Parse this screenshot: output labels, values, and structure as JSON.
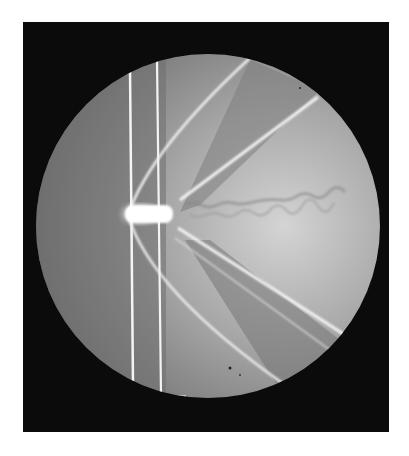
{
  "image": {
    "description": "Shadowgraph photograph of a bullet in supersonic flight showing bow shock, trailing shock waves and turbulent wake inside a circular viewing field",
    "colors": {
      "background": "#ffffff",
      "frame": "#0b0b0b",
      "field_dark": "#6e6e6e",
      "field_light": "#c8c8c8",
      "shock_lines": "#f2f2f2"
    }
  }
}
